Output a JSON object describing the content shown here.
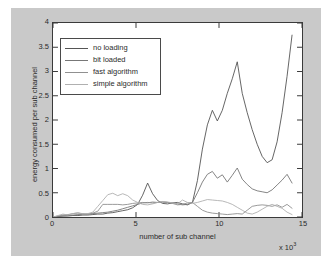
{
  "figure": {
    "background_color": "#c9c9c9",
    "plot_background_color": "#ffffff",
    "axis_color": "#3a3a3a"
  },
  "chart_data": {
    "type": "line",
    "title": "",
    "xlabel": "number of sub channel",
    "ylabel": "energy consumed per sub channel",
    "x_multiplier_text": "x 10",
    "x_multiplier_exponent": "3",
    "xlim": [
      0,
      15
    ],
    "ylim": [
      0,
      4
    ],
    "xticks": [
      0,
      5,
      10,
      15
    ],
    "xtick_labels": [
      "0",
      "5",
      "10",
      "15"
    ],
    "yticks": [
      0,
      0.5,
      1,
      1.5,
      2,
      2.5,
      3,
      3.5,
      4
    ],
    "ytick_labels": [
      "0",
      "0.5",
      "1",
      "1.5",
      "2",
      "2.5",
      "3",
      "3.5",
      "4"
    ],
    "grid": false,
    "legend_position": "upper left inside axes",
    "legend_entries": [
      "no loading",
      "bit loaded",
      "fast algorithm",
      "simple algorithm"
    ],
    "series": [
      {
        "name": "no loading",
        "color": "#555555",
        "x": [
          0,
          0.3,
          0.6,
          0.9,
          1.2,
          1.5,
          1.8,
          2.1,
          2.4,
          2.7,
          3.0,
          3.3,
          3.6,
          3.9,
          4.2,
          4.5,
          4.8,
          5.1,
          5.4,
          5.7,
          6.0,
          6.3,
          6.6,
          6.9,
          7.2,
          7.5,
          7.8,
          8.1,
          8.4,
          8.7,
          9.0,
          9.3,
          9.6,
          9.9,
          10.2,
          10.5,
          10.8,
          11.1,
          11.4,
          11.7,
          12.0,
          12.3,
          12.6,
          12.9,
          13.2,
          13.5,
          13.8,
          14.1,
          14.4
        ],
        "y": [
          0.0,
          0.01,
          0.02,
          0.02,
          0.03,
          0.03,
          0.04,
          0.04,
          0.05,
          0.06,
          0.06,
          0.08,
          0.09,
          0.11,
          0.13,
          0.15,
          0.19,
          0.26,
          0.45,
          0.7,
          0.48,
          0.34,
          0.28,
          0.27,
          0.29,
          0.3,
          0.27,
          0.25,
          0.3,
          0.75,
          1.4,
          1.9,
          2.2,
          1.98,
          2.2,
          2.55,
          2.85,
          3.2,
          2.55,
          2.15,
          1.8,
          1.5,
          1.25,
          1.12,
          1.18,
          1.55,
          2.15,
          2.9,
          3.75
        ]
      },
      {
        "name": "bit loaded",
        "color": "#777777",
        "x": [
          0,
          0.3,
          0.6,
          0.9,
          1.2,
          1.5,
          1.8,
          2.1,
          2.4,
          2.7,
          3.0,
          3.3,
          3.6,
          3.9,
          4.2,
          4.5,
          4.8,
          5.1,
          5.4,
          5.7,
          6.0,
          6.3,
          6.6,
          6.9,
          7.2,
          7.5,
          7.8,
          8.1,
          8.4,
          8.7,
          9.0,
          9.3,
          9.6,
          9.9,
          10.2,
          10.5,
          10.8,
          11.1,
          11.4,
          11.7,
          12.0,
          12.3,
          12.6,
          12.9,
          13.2,
          13.5,
          13.8,
          14.1,
          14.4
        ],
        "y": [
          0.0,
          0.01,
          0.02,
          0.03,
          0.04,
          0.05,
          0.05,
          0.06,
          0.07,
          0.08,
          0.09,
          0.1,
          0.12,
          0.14,
          0.17,
          0.2,
          0.23,
          0.26,
          0.29,
          0.3,
          0.29,
          0.3,
          0.31,
          0.3,
          0.29,
          0.27,
          0.25,
          0.26,
          0.3,
          0.5,
          0.72,
          0.88,
          0.94,
          0.8,
          0.87,
          0.72,
          0.86,
          1.01,
          0.78,
          0.67,
          0.58,
          0.54,
          0.52,
          0.5,
          0.56,
          0.66,
          0.76,
          0.88,
          0.7
        ]
      },
      {
        "name": "fast algorithm",
        "color": "#909090",
        "x": [
          0,
          0.3,
          0.6,
          0.9,
          1.2,
          1.5,
          1.8,
          2.1,
          2.4,
          2.7,
          3.0,
          3.3,
          3.6,
          3.9,
          4.2,
          4.5,
          4.8,
          5.1,
          5.4,
          5.7,
          6.0,
          6.3,
          6.6,
          6.9,
          7.2,
          7.5,
          7.8,
          8.1,
          8.4,
          8.7,
          9.0,
          9.3,
          9.6,
          9.9,
          10.2,
          10.5,
          10.8,
          11.1,
          11.4,
          11.7,
          12.0,
          12.3,
          12.6,
          12.9,
          13.2,
          13.5,
          13.8,
          14.1,
          14.4
        ],
        "y": [
          0.0,
          0.02,
          0.04,
          0.05,
          0.07,
          0.08,
          0.07,
          0.06,
          0.08,
          0.12,
          0.26,
          0.26,
          0.26,
          0.26,
          0.25,
          0.26,
          0.28,
          0.29,
          0.3,
          0.29,
          0.31,
          0.3,
          0.31,
          0.3,
          0.28,
          0.25,
          0.26,
          0.29,
          0.3,
          0.22,
          0.14,
          0.1,
          0.08,
          0.07,
          0.06,
          0.05,
          0.06,
          0.07,
          0.06,
          0.14,
          0.22,
          0.24,
          0.25,
          0.24,
          0.22,
          0.25,
          0.2,
          0.26,
          0.18
        ]
      },
      {
        "name": "simple algorithm",
        "color": "#b0b0b0",
        "x": [
          0,
          0.3,
          0.6,
          0.9,
          1.2,
          1.5,
          1.8,
          2.1,
          2.4,
          2.7,
          3.0,
          3.3,
          3.6,
          3.9,
          4.2,
          4.5,
          4.8,
          5.1,
          5.4,
          5.7,
          6.0,
          6.3,
          6.6,
          6.9,
          7.2,
          7.5,
          7.8,
          8.1,
          8.4,
          8.7,
          9.0,
          9.3,
          9.6,
          9.9,
          10.2,
          10.5,
          10.8,
          11.1,
          11.4,
          11.7,
          12.0,
          12.3,
          12.6,
          12.9,
          13.2,
          13.5,
          13.8,
          14.1,
          14.4
        ],
        "y": [
          0.0,
          0.03,
          0.06,
          0.04,
          0.07,
          0.09,
          0.06,
          0.07,
          0.1,
          0.22,
          0.34,
          0.46,
          0.49,
          0.44,
          0.48,
          0.44,
          0.35,
          0.3,
          0.26,
          0.25,
          0.27,
          0.3,
          0.32,
          0.31,
          0.29,
          0.27,
          0.35,
          0.3,
          0.28,
          0.3,
          0.33,
          0.36,
          0.35,
          0.34,
          0.33,
          0.3,
          0.26,
          0.2,
          0.14,
          0.08,
          0.06,
          0.1,
          0.16,
          0.22,
          0.26,
          0.22,
          0.18,
          0.1,
          0.05
        ]
      }
    ]
  }
}
